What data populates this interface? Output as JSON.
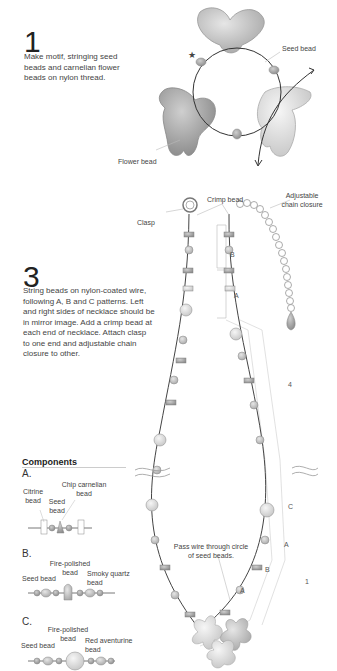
{
  "step1": {
    "number": "1",
    "text": "Make motif, stringing seed beads and carnelian flower beads on nylon thread.",
    "labels": {
      "seed_bead": "Seed bead",
      "flower_bead": "Flower bead",
      "star": "★"
    }
  },
  "step3": {
    "number": "3",
    "text": "String beads on nylon-coated wire, following A, B and C patterns. Left and right sides of necklace should be in mirror image. Add a crimp bead at each end of necklace. Attach clasp to one end and adjustable chain closure to other.",
    "labels": {
      "clasp": "Clasp",
      "crimp_bead": "Crimp bead",
      "adjustable_chain": "Adjustable chain closure",
      "pass_wire": "Pass wire through circle of seed beads."
    },
    "markers": [
      "B",
      "A",
      "4",
      "C",
      "A",
      "B",
      "A",
      "1"
    ]
  },
  "components": {
    "title": "Components",
    "A": {
      "letter": "A.",
      "labels": [
        "Citrine bead",
        "Seed bead",
        "Chip carnelian bead"
      ]
    },
    "B": {
      "letter": "B.",
      "labels": [
        "Seed bead",
        "Fire-polished bead",
        "Smoky quartz bead"
      ]
    },
    "C": {
      "letter": "C.",
      "labels": [
        "Seed bead",
        "Fire-polished bead",
        "Red aventurine bead"
      ]
    }
  }
}
